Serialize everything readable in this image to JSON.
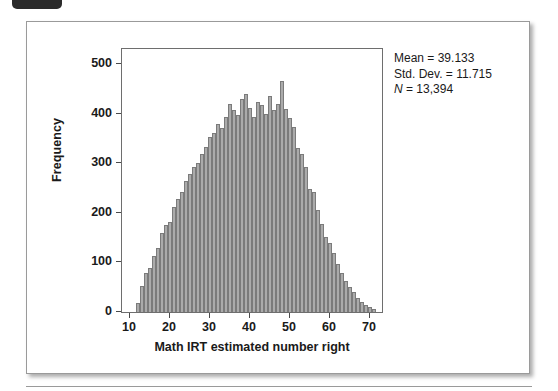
{
  "figure": {
    "badge_label": "",
    "y_axis_title": "Frequency",
    "x_axis_title": "Math IRT estimated number right",
    "y_ticks": [
      "0",
      "100",
      "200",
      "300",
      "400",
      "500"
    ],
    "x_ticks": [
      "10",
      "20",
      "30",
      "40",
      "50",
      "60",
      "70"
    ],
    "stats": {
      "mean": "Mean = 39.133",
      "std_dev": "Std. Dev. = 11.715",
      "n_symbol": "N",
      "n_value": " = 13,394"
    }
  },
  "chart_data": {
    "type": "bar",
    "title": "",
    "xlabel": "Math IRT estimated number right",
    "ylabel": "Frequency",
    "xlim": [
      8,
      73
    ],
    "ylim": [
      0,
      530
    ],
    "xticks": [
      10,
      20,
      30,
      40,
      50,
      60,
      70
    ],
    "yticks": [
      0,
      100,
      200,
      300,
      400,
      500
    ],
    "grid": false,
    "legend": false,
    "bar_color": "#ababab",
    "bar_edge_color": "#7b7b7b",
    "bin_width": 1,
    "annotations": [
      "Mean = 39.133",
      "Std. Dev. = 11.715",
      "N = 13,394"
    ],
    "summary": {
      "mean": 39.133,
      "std_dev": 11.715,
      "n": 13394
    },
    "x": [
      12,
      13,
      14,
      15,
      16,
      17,
      18,
      19,
      20,
      21,
      22,
      23,
      24,
      25,
      26,
      27,
      28,
      29,
      30,
      31,
      32,
      33,
      34,
      35,
      36,
      37,
      38,
      39,
      40,
      41,
      42,
      43,
      44,
      45,
      46,
      47,
      48,
      49,
      50,
      51,
      52,
      53,
      54,
      55,
      56,
      57,
      58,
      59,
      60,
      61,
      62,
      63,
      64,
      65,
      66,
      67,
      68,
      69,
      70,
      71
    ],
    "values": [
      18,
      52,
      78,
      88,
      112,
      130,
      160,
      175,
      182,
      212,
      228,
      242,
      265,
      278,
      292,
      300,
      318,
      332,
      352,
      360,
      378,
      370,
      392,
      420,
      408,
      398,
      430,
      440,
      412,
      392,
      424,
      418,
      400,
      436,
      408,
      420,
      465,
      410,
      390,
      372,
      330,
      318,
      292,
      248,
      242,
      205,
      178,
      152,
      140,
      118,
      96,
      78,
      62,
      50,
      40,
      28,
      20,
      14,
      10,
      6
    ]
  }
}
